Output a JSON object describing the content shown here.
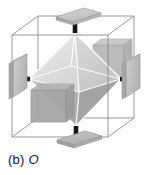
{
  "figure": {
    "caption_label": "(b)",
    "caption_symbol": "O",
    "background_color": "#ffffff",
    "cube": {
      "name": "wireframe-cube",
      "edge_color": "#8d8d8d",
      "edge_width": 0.9,
      "vertices": {
        "front_top_left": [
          12,
          35
        ],
        "front_top_right": [
          108,
          35
        ],
        "front_bottom_left": [
          12,
          137
        ],
        "front_bottom_right": [
          108,
          137
        ],
        "back_top_left": [
          38,
          16
        ],
        "back_top_right": [
          134,
          16
        ],
        "back_bottom_left": [
          38,
          118
        ],
        "back_bottom_right": [
          134,
          118
        ]
      }
    },
    "octahedron": {
      "name": "octahedron-solid",
      "edge_color": "#ffffff",
      "edge_width": 1.1,
      "vertices": {
        "top": [
          75,
          33
        ],
        "bottom": [
          76,
          126
        ],
        "left": [
          29,
          79
        ],
        "right": [
          121,
          79
        ],
        "front": [
          79,
          92
        ],
        "back": [
          71,
          66
        ]
      },
      "face_colors": {
        "upper_left": "#e3e3e3",
        "upper_front": "#d3d3d3",
        "upper_right": "#c9c9c9",
        "lower_left": "#d8d8d8",
        "lower_front": "#b9b9b9",
        "lower_right": "#a8a8a8"
      }
    },
    "axes": {
      "count": 3,
      "label": "three four-fold rotation axes",
      "rod_color": "#141414"
    },
    "plates": [
      {
        "id": "plate-top-outer",
        "position": "top",
        "face_color": "#c8c8c8",
        "edge_color": "#9a9a9a",
        "side_color": "#a9a9a9"
      },
      {
        "id": "plate-bottom-outer",
        "position": "bottom",
        "face_color": "#b8b8b8",
        "edge_color": "#909090",
        "side_color": "#9c9c9c"
      },
      {
        "id": "plate-left-outer",
        "position": "left",
        "face_color": "#c0c0c0",
        "edge_color": "#979797",
        "side_color": "#a3a3a3"
      },
      {
        "id": "plate-right-outer",
        "position": "right",
        "face_color": "#c4c4c4",
        "edge_color": "#999999",
        "side_color": "#a6a6a6"
      },
      {
        "id": "plate-back-inner",
        "position": "back-upper-right",
        "face_color": "#b4b4b4",
        "edge_color": "#a0a0a0",
        "side_color": "#a0a0a0"
      },
      {
        "id": "plate-front-inner",
        "position": "front-lower-left",
        "face_color": "#a5a5a5",
        "edge_color": "#8f8f8f",
        "side_color": "#8f8f8f"
      }
    ],
    "rods": [
      {
        "id": "rod-top",
        "from": [
          75,
          33
        ],
        "to": [
          75,
          17
        ],
        "width": 4.6
      },
      {
        "id": "rod-bottom",
        "from": [
          76,
          126
        ],
        "to": [
          76,
          142
        ],
        "width": 4.6
      },
      {
        "id": "rod-left",
        "from": [
          29,
          79
        ],
        "to": [
          13,
          79
        ],
        "width": 4.6
      },
      {
        "id": "rod-right",
        "from": [
          121,
          79
        ],
        "to": [
          137,
          79
        ],
        "width": 4.6
      }
    ]
  }
}
